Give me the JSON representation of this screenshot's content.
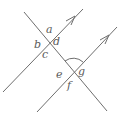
{
  "diagram": {
    "type": "parallel-lines-transversal",
    "line_color": "#6e6e6e",
    "label_color": "#5a5a5a",
    "lines": [
      {
        "name": "transversal",
        "x1": 24,
        "y1": 12,
        "x2": 107,
        "y2": 111,
        "arrow": false
      },
      {
        "name": "upper-parallel",
        "x1": 3,
        "y1": 92,
        "x2": 83,
        "y2": 9,
        "arrow": true
      },
      {
        "name": "lower-parallel",
        "x1": 37,
        "y1": 112,
        "x2": 117,
        "y2": 27,
        "arrow": true
      }
    ],
    "intersections": {
      "upper": {
        "x": 49,
        "y": 42
      },
      "lower": {
        "x": 74,
        "y": 72
      }
    },
    "labels": {
      "a": "a",
      "b": "b",
      "c": "c",
      "d": "d",
      "e": "e",
      "f": "f",
      "g": "g"
    },
    "marked_angle": "angle between lower-parallel (upward) and transversal (upward) at lower intersection"
  }
}
